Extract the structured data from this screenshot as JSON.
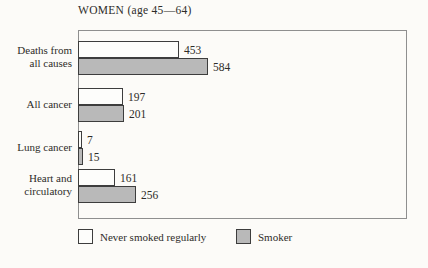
{
  "title": "WOMEN (age 45—64)",
  "colors": {
    "background": "#fcfbf8",
    "bar_border": "#3d3d3d",
    "frame_border": "#8f8f8f",
    "never_smoked_fill": "#fdfdfb",
    "smoker_fill": "#b9b9b9"
  },
  "legend": {
    "items": [
      {
        "label": "Never smoked regularly",
        "swatch": "white"
      },
      {
        "label": "Smoker",
        "swatch": "gray"
      }
    ]
  },
  "chart_data": {
    "type": "bar",
    "orientation": "horizontal",
    "title": "WOMEN (age 45—64)",
    "categories": [
      "Deaths from all causes",
      "All cancer",
      "Lung cancer",
      "Heart and circulatory"
    ],
    "category_lines": [
      [
        "Deaths from",
        "all causes"
      ],
      [
        "All cancer"
      ],
      [
        "Lung cancer"
      ],
      [
        "Heart and",
        "circulatory"
      ]
    ],
    "series": [
      {
        "name": "Never smoked regularly",
        "values": [
          453,
          197,
          7,
          161
        ]
      },
      {
        "name": "Smoker",
        "values": [
          584,
          201,
          15,
          256
        ]
      }
    ],
    "value_labels": true,
    "xlim": [
      0,
      1500
    ],
    "grid": false,
    "legend_position": "bottom"
  }
}
